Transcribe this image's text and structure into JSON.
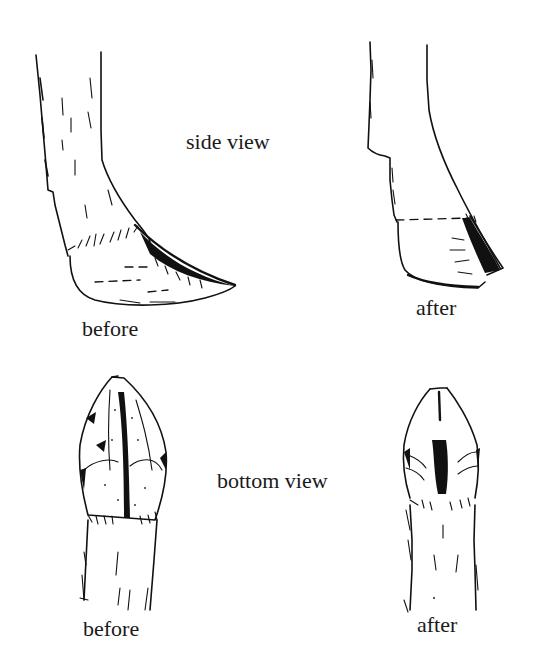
{
  "diagram": {
    "sections": [
      {
        "id": "side",
        "label": "side view",
        "panels": [
          {
            "state": "before",
            "caption": "before"
          },
          {
            "state": "after",
            "caption": "after"
          }
        ]
      },
      {
        "id": "bottom",
        "label": "bottom view",
        "panels": [
          {
            "state": "before",
            "caption": "before"
          },
          {
            "state": "after",
            "caption": "after"
          }
        ]
      }
    ],
    "colors": {
      "ink": "#111111",
      "background": "#ffffff"
    }
  }
}
